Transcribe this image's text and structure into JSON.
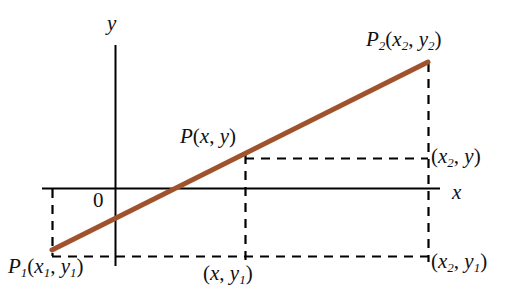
{
  "figure": {
    "background_color": "#ffffff",
    "axis_color": "#000000",
    "line_color": "#a0522d",
    "dash_color": "#000000",
    "text_color": "#111111"
  },
  "axes": {
    "x_label": "x",
    "y_label": "y",
    "origin_label": "0"
  },
  "points": {
    "p1": {
      "name": "P",
      "subscript": "1",
      "x_text": "x",
      "x_sub": "1",
      "y_text": "y",
      "y_sub": "1",
      "full": "P₁(x₁, y₁)"
    },
    "p": {
      "name": "P",
      "subscript": "",
      "x_text": "x",
      "x_sub": "",
      "y_text": "y",
      "y_sub": "",
      "full": "P(x, y)"
    },
    "p2": {
      "name": "P",
      "subscript": "2",
      "x_text": "x",
      "x_sub": "2",
      "y_text": "y",
      "y_sub": "2",
      "full": "P₂(x₂, y₂)"
    }
  },
  "coordinate_labels": {
    "foot_of_p": {
      "x_text": "x",
      "x_sub": "",
      "y_text": "y",
      "y_sub": "1",
      "full": "(x, y₁)"
    },
    "right_of_p": {
      "x_text": "x",
      "x_sub": "2",
      "y_text": "y",
      "y_sub": "",
      "full": "(x₂, y)"
    },
    "foot_of_p2": {
      "x_text": "x",
      "x_sub": "2",
      "y_text": "y",
      "y_sub": "1",
      "full": "(x₂, y₁)"
    }
  },
  "punctuation": {
    "open_paren": "(",
    "close_paren": ")",
    "comma": ","
  },
  "chart_data": {
    "type": "line",
    "xlabel": "x",
    "ylabel": "y",
    "grid": false,
    "legend": null,
    "axis_pixel_geometry": {
      "x_axis_y": 188,
      "x_axis_x_start": 42,
      "x_axis_x_end": 440,
      "y_axis_x": 115,
      "y_axis_y_start": 45,
      "y_axis_y_end": 266
    },
    "series": [
      {
        "name": "line through P1 and P2",
        "color": "#a0522d",
        "points_pixel": [
          [
            52,
            250
          ],
          [
            428,
            62
          ]
        ]
      }
    ],
    "annotated_points": [
      {
        "label": "P₁(x₁, y₁)",
        "pixel": [
          52,
          250
        ]
      },
      {
        "label": "P(x, y)",
        "pixel": [
          245,
          153
        ]
      },
      {
        "label": "P₂(x₂, y₂)",
        "pixel": [
          428,
          62
        ]
      }
    ],
    "dashed_guides_pixel": [
      {
        "name": "vertical-from-p1",
        "from": [
          52,
          188
        ],
        "to": [
          52,
          256
        ]
      },
      {
        "name": "vertical-from-p",
        "from": [
          245,
          153
        ],
        "to": [
          245,
          260
        ]
      },
      {
        "name": "vertical-from-p2",
        "from": [
          428,
          62
        ],
        "to": [
          428,
          260
        ]
      },
      {
        "name": "horizontal-baseline",
        "from": [
          52,
          256
        ],
        "to": [
          428,
          256
        ]
      },
      {
        "name": "horizontal-from-p",
        "from": [
          245,
          158
        ],
        "to": [
          428,
          158
        ]
      }
    ]
  }
}
